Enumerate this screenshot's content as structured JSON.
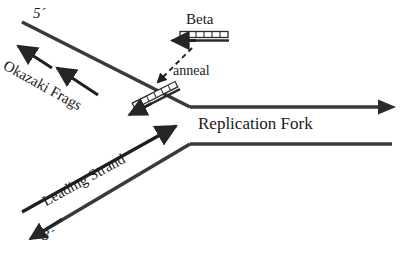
{
  "figure": {
    "background_color": "#ffffff",
    "stroke_color": "#262626",
    "text_color": "#1a1a1a"
  },
  "labels": {
    "five_prime": "5´",
    "three_prime": "3´",
    "beta": "Beta",
    "anneal": "anneal",
    "replication_fork": "Replication Fork",
    "okazaki_frags": "Okazaki Frags",
    "leading_strand": "Leading Strand"
  },
  "elements": {
    "lagging_strand_line": "upper diagonal template strand running from lower-right fork junction up to the 5´ end at upper left",
    "leading_strand_line": "lower diagonal template strand running from the fork junction down to the 3´ end at lower left",
    "duplex_top_line": "upper horizontal parental duplex strand extending right from the fork with arrowhead",
    "duplex_bottom_line": "lower horizontal parental duplex strand extending right from the fork, flat end",
    "okazaki_arrow_1": "short arrow pointing up-left along the lagging strand",
    "okazaki_arrow_2": "second short arrow pointing up-left along the lagging strand",
    "leading_strand_arrow": "long arrow pointing up-right toward the fork junction",
    "three_prime_arrowhead": "arrowhead at the 3´ terminus pointing down-left",
    "beta_clamp_free": "free beta clamp drawn as a segmented bar with a leftward arrow, above the fork",
    "beta_clamp_bound": "beta clamp bound on the lagging strand drawn as a segmented bar with an up-left arrow",
    "anneal_dashed_arrow": "dashed arrow from the free beta clamp pointing down-left to the bound clamp"
  },
  "clamp": {
    "segment_count": 6
  }
}
